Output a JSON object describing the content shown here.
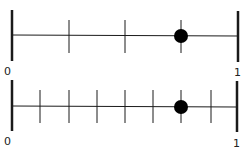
{
  "number_lines": [
    {
      "label_start": "0",
      "label_end": "1",
      "divisions": 4,
      "point_fraction": "3/4",
      "point_value": 0.75
    },
    {
      "label_start": "0",
      "label_end": "1",
      "divisions": 8,
      "point_fraction": "6/8",
      "point_value": 0.75
    }
  ],
  "colors": {
    "line": "#1a1a1a",
    "point": "#000000"
  }
}
